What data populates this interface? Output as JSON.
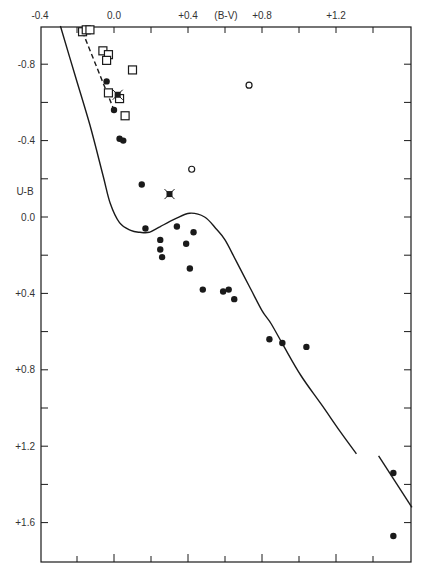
{
  "chart_data": {
    "type": "scatter",
    "title": "",
    "xlabel": "(B-V)",
    "ylabel": "U-B",
    "xlim": [
      -0.4,
      1.6
    ],
    "ylim": [
      1.8,
      -1.0
    ],
    "y_inverted": true,
    "grid": false,
    "legend": null,
    "x_tick_labels": [
      {
        "value": -0.4,
        "label": "-0.4"
      },
      {
        "value": 0.0,
        "label": "0.0"
      },
      {
        "value": 0.4,
        "label": "+0.4"
      },
      {
        "value": 0.8,
        "label": "+0.8"
      },
      {
        "value": 1.2,
        "label": "+1.2"
      }
    ],
    "x_minor_ticks": [
      -0.2,
      0.2,
      0.6,
      1.0,
      1.4
    ],
    "y_tick_labels": [
      {
        "value": -0.8,
        "label": "-0.8"
      },
      {
        "value": -0.4,
        "label": "-0.4"
      },
      {
        "value": 0.0,
        "label": "0.0"
      },
      {
        "value": 0.4,
        "label": "+0.4"
      },
      {
        "value": 0.8,
        "label": "+0.8"
      },
      {
        "value": 1.2,
        "label": "+1.2"
      },
      {
        "value": 1.6,
        "label": "+1.6"
      }
    ],
    "y_minor_ticks": [
      -0.6,
      -0.2,
      0.2,
      0.6,
      1.0,
      1.4
    ],
    "series": [
      {
        "name": "open squares",
        "marker": "square-open",
        "points": [
          [
            -0.17,
            -0.97
          ],
          [
            -0.15,
            -0.98
          ],
          [
            -0.13,
            -0.98
          ],
          [
            -0.06,
            -0.87
          ],
          [
            -0.03,
            -0.85
          ],
          [
            -0.04,
            -0.82
          ],
          [
            0.1,
            -0.77
          ],
          [
            -0.03,
            -0.65
          ],
          [
            0.03,
            -0.62
          ],
          [
            0.06,
            -0.53
          ]
        ]
      },
      {
        "name": "filled circles",
        "marker": "circle-filled",
        "points": [
          [
            -0.04,
            -0.71
          ],
          [
            0.0,
            -0.56
          ],
          [
            0.03,
            -0.41
          ],
          [
            0.05,
            -0.4
          ],
          [
            0.15,
            -0.17
          ],
          [
            0.17,
            0.06
          ],
          [
            0.34,
            0.05
          ],
          [
            0.25,
            0.12
          ],
          [
            0.43,
            0.08
          ],
          [
            0.25,
            0.17
          ],
          [
            0.39,
            0.14
          ],
          [
            0.26,
            0.21
          ],
          [
            0.41,
            0.27
          ],
          [
            0.48,
            0.38
          ],
          [
            0.59,
            0.39
          ],
          [
            0.62,
            0.38
          ],
          [
            0.65,
            0.43
          ],
          [
            0.84,
            0.64
          ],
          [
            0.91,
            0.66
          ],
          [
            1.04,
            0.68
          ],
          [
            1.51,
            1.34
          ],
          [
            1.51,
            1.67
          ]
        ]
      },
      {
        "name": "open circles",
        "marker": "circle-open",
        "points": [
          [
            0.73,
            -0.69
          ],
          [
            0.42,
            -0.25
          ]
        ]
      },
      {
        "name": "starred squares",
        "marker": "square-star",
        "points": [
          [
            0.02,
            -0.64
          ],
          [
            0.3,
            -0.12
          ]
        ]
      }
    ],
    "lines": [
      {
        "name": "main sequence curve",
        "style": "solid",
        "points": [
          [
            -0.29,
            -1.0
          ],
          [
            -0.21,
            -0.74
          ],
          [
            -0.13,
            -0.48
          ],
          [
            -0.06,
            -0.22
          ],
          [
            -0.02,
            -0.07
          ],
          [
            0.03,
            0.03
          ],
          [
            0.09,
            0.07
          ],
          [
            0.14,
            0.08
          ],
          [
            0.19,
            0.08
          ],
          [
            0.25,
            0.05
          ],
          [
            0.33,
            0.01
          ],
          [
            0.41,
            -0.02
          ],
          [
            0.49,
            0.0
          ],
          [
            0.55,
            0.06
          ],
          [
            0.6,
            0.12
          ],
          [
            0.66,
            0.23
          ],
          [
            0.73,
            0.36
          ],
          [
            0.8,
            0.49
          ],
          [
            0.85,
            0.56
          ],
          [
            0.92,
            0.68
          ],
          [
            1.01,
            0.83
          ],
          [
            1.12,
            0.98
          ],
          [
            1.22,
            1.12
          ],
          [
            1.31,
            1.24
          ]
        ]
      },
      {
        "name": "giant branch segment",
        "style": "solid",
        "points": [
          [
            1.43,
            1.25
          ],
          [
            1.61,
            1.52
          ]
        ]
      },
      {
        "name": "reddening line",
        "style": "dashed",
        "points": [
          [
            -0.17,
            -0.97
          ],
          [
            0.0,
            -0.56
          ]
        ]
      }
    ]
  }
}
